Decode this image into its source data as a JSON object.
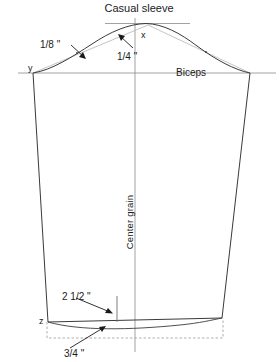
{
  "diagram": {
    "title": "Casual sleeve",
    "type": "sewing-pattern-draft",
    "labels": {
      "title": "Casual sleeve",
      "biceps": "Biceps",
      "center_grain": "Center grain",
      "cap_left_offset": "1/8 \"",
      "cap_right_offset": "1/4 \"",
      "hem_depth": "2 1/2 \"",
      "hem_curve_drop": "3/4 \"",
      "point_x": "x",
      "point_y": "y",
      "point_z": "z"
    },
    "colors": {
      "outline": "#3a3a3a",
      "chord": "#b0b0b0",
      "guide": "#8a8a8a",
      "dashed": "#9a9a9a",
      "text": "#1a1a1a",
      "background": "#ffffff"
    },
    "annotations": [
      {
        "name": "cap-left-offset",
        "text": "1/8 \"",
        "measure": "1/8 inch"
      },
      {
        "name": "cap-right-offset",
        "text": "1/4 \"",
        "measure": "1/4 inch"
      },
      {
        "name": "hem-depth",
        "text": "2 1/2 \"",
        "measure": "2 1/2 inch"
      },
      {
        "name": "hem-curve-drop",
        "text": "3/4 \"",
        "measure": "3/4 inch"
      }
    ],
    "points": [
      {
        "name": "x",
        "label": "x",
        "role": "cap-apex"
      },
      {
        "name": "y",
        "label": "y",
        "role": "left-biceps-point"
      },
      {
        "name": "z",
        "label": "z",
        "role": "left-hem-point"
      }
    ]
  }
}
